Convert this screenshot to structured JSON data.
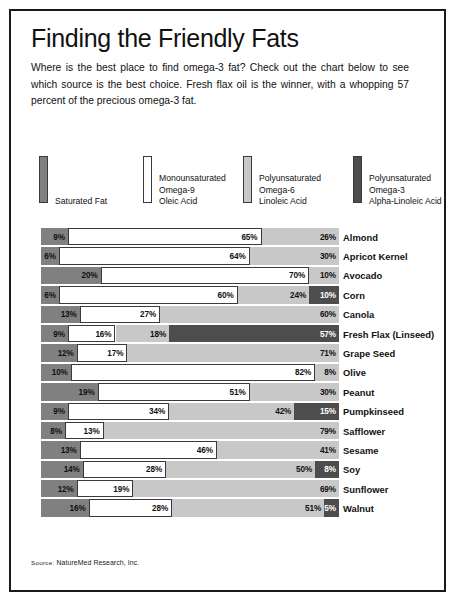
{
  "title": "Finding the Friendly Fats",
  "intro": "Where is the best place to find omega-3 fat? Check out the chart below to see which source is the best choice. Fresh flax oil is the winner, with a whopping 57 percent of the precious omega-3 fat.",
  "source": {
    "label": "Source:",
    "text": "NatureMed Research, Inc."
  },
  "colors": {
    "saturated": "#808080",
    "mono_omega9": "#ffffff",
    "poly_omega6": "#c8c8c8",
    "poly_omega3": "#4d4d4d",
    "border": "#3a3a3a",
    "frame": "#1a1a1a"
  },
  "legend": [
    {
      "key": "saturated",
      "swatch": "#808080",
      "lines": [
        "Saturated Fat"
      ]
    },
    {
      "key": "mono_omega9",
      "swatch": "#ffffff",
      "lines": [
        "Monounsaturated",
        "Omega-9",
        "Oleic Acid"
      ]
    },
    {
      "key": "poly_omega6",
      "swatch": "#c8c8c8",
      "lines": [
        "Polyunsaturated",
        "Omega-6",
        "Linoleic Acid"
      ]
    },
    {
      "key": "poly_omega3",
      "swatch": "#4d4d4d",
      "lines": [
        "Polyunsaturated",
        "Omega-3",
        "Alpha-Linoleic Acid"
      ]
    }
  ],
  "chart_data": {
    "type": "bar",
    "subtype": "stacked-horizontal-100",
    "title": "Finding the Friendly Fats",
    "xlabel": "",
    "ylabel": "",
    "xlim": [
      0,
      100
    ],
    "grid": false,
    "legend_position": "top",
    "value_suffix": "%",
    "categories": [
      "Almond",
      "Apricot Kernel",
      "Avocado",
      "Corn",
      "Canola",
      "Fresh Flax (Linseed)",
      "Grape Seed",
      "Olive",
      "Peanut",
      "Pumpkinseed",
      "Safflower",
      "Sesame",
      "Soy",
      "Sunflower",
      "Walnut"
    ],
    "series": [
      {
        "name": "Saturated Fat",
        "color": "#808080",
        "values": [
          9,
          6,
          20,
          6,
          13,
          9,
          12,
          10,
          19,
          9,
          8,
          13,
          14,
          12,
          16
        ]
      },
      {
        "name": "Monounsaturated Omega-9 Oleic Acid",
        "color": "#ffffff",
        "values": [
          65,
          64,
          70,
          60,
          27,
          16,
          17,
          82,
          51,
          34,
          13,
          46,
          28,
          19,
          28
        ]
      },
      {
        "name": "Polyunsaturated Omega-6 Linoleic Acid",
        "color": "#c8c8c8",
        "values": [
          26,
          30,
          10,
          24,
          60,
          18,
          71,
          8,
          30,
          42,
          79,
          41,
          50,
          69,
          51
        ]
      },
      {
        "name": "Polyunsaturated Omega-3 Alpha-Linoleic Acid",
        "color": "#4d4d4d",
        "values": [
          0,
          0,
          0,
          10,
          0,
          57,
          0,
          0,
          0,
          15,
          0,
          0,
          8,
          0,
          5
        ]
      }
    ],
    "rows": [
      {
        "label": "Almond",
        "segments": [
          {
            "series": "saturated",
            "value": "9%"
          },
          {
            "series": "mono_omega9",
            "value": "65%"
          },
          {
            "series": "poly_omega6",
            "value": "26%"
          }
        ]
      },
      {
        "label": "Apricot Kernel",
        "segments": [
          {
            "series": "saturated",
            "value": "6%"
          },
          {
            "series": "mono_omega9",
            "value": "64%"
          },
          {
            "series": "poly_omega6",
            "value": "30%"
          }
        ]
      },
      {
        "label": "Avocado",
        "segments": [
          {
            "series": "saturated",
            "value": "20%"
          },
          {
            "series": "mono_omega9",
            "value": "70%"
          },
          {
            "series": "poly_omega6",
            "value": "10%"
          }
        ]
      },
      {
        "label": "Corn",
        "segments": [
          {
            "series": "saturated",
            "value": "6%"
          },
          {
            "series": "mono_omega9",
            "value": "60%"
          },
          {
            "series": "poly_omega6",
            "value": "24%"
          },
          {
            "series": "poly_omega3",
            "value": "10%"
          }
        ]
      },
      {
        "label": "Canola",
        "segments": [
          {
            "series": "saturated",
            "value": "13%"
          },
          {
            "series": "mono_omega9",
            "value": "27%"
          },
          {
            "series": "poly_omega6",
            "value": "60%"
          }
        ]
      },
      {
        "label": "Fresh Flax (Linseed)",
        "segments": [
          {
            "series": "saturated",
            "value": "9%"
          },
          {
            "series": "mono_omega9",
            "value": "16%"
          },
          {
            "series": "poly_omega6",
            "value": "18%"
          },
          {
            "series": "poly_omega3",
            "value": "57%"
          }
        ]
      },
      {
        "label": "Grape Seed",
        "segments": [
          {
            "series": "saturated",
            "value": "12%"
          },
          {
            "series": "mono_omega9",
            "value": "17%"
          },
          {
            "series": "poly_omega6",
            "value": "71%"
          }
        ]
      },
      {
        "label": "Olive",
        "segments": [
          {
            "series": "saturated",
            "value": "10%"
          },
          {
            "series": "mono_omega9",
            "value": "82%"
          },
          {
            "series": "poly_omega6",
            "value": "8%"
          }
        ]
      },
      {
        "label": "Peanut",
        "segments": [
          {
            "series": "saturated",
            "value": "19%"
          },
          {
            "series": "mono_omega9",
            "value": "51%"
          },
          {
            "series": "poly_omega6",
            "value": "30%"
          }
        ]
      },
      {
        "label": "Pumpkinseed",
        "segments": [
          {
            "series": "saturated",
            "value": "9%"
          },
          {
            "series": "mono_omega9",
            "value": "34%"
          },
          {
            "series": "poly_omega6",
            "value": "42%"
          },
          {
            "series": "poly_omega3",
            "value": "15%"
          }
        ]
      },
      {
        "label": "Safflower",
        "segments": [
          {
            "series": "saturated",
            "value": "8%"
          },
          {
            "series": "mono_omega9",
            "value": "13%"
          },
          {
            "series": "poly_omega6",
            "value": "79%"
          }
        ]
      },
      {
        "label": "Sesame",
        "segments": [
          {
            "series": "saturated",
            "value": "13%"
          },
          {
            "series": "mono_omega9",
            "value": "46%"
          },
          {
            "series": "poly_omega6",
            "value": "41%"
          }
        ]
      },
      {
        "label": "Soy",
        "segments": [
          {
            "series": "saturated",
            "value": "14%"
          },
          {
            "series": "mono_omega9",
            "value": "28%"
          },
          {
            "series": "poly_omega6",
            "value": "50%"
          },
          {
            "series": "poly_omega3",
            "value": "8%"
          }
        ]
      },
      {
        "label": "Sunflower",
        "segments": [
          {
            "series": "saturated",
            "value": "12%"
          },
          {
            "series": "mono_omega9",
            "value": "19%"
          },
          {
            "series": "poly_omega6",
            "value": "69%"
          }
        ]
      },
      {
        "label": "Walnut",
        "segments": [
          {
            "series": "saturated",
            "value": "16%"
          },
          {
            "series": "mono_omega9",
            "value": "28%"
          },
          {
            "series": "poly_omega6",
            "value": "51%"
          },
          {
            "series": "poly_omega3",
            "value": "5%"
          }
        ]
      }
    ]
  }
}
